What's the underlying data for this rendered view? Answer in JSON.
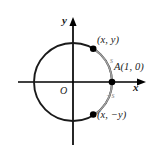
{
  "figure": {
    "background_color": "#ffffff",
    "axes": {
      "x_label": "x",
      "y_label": "y",
      "origin_label": "O",
      "axis_color": "#000000",
      "x_axis_y_px": 82,
      "y_axis_x_px": 73,
      "x_axis_span_px": [
        18,
        146
      ],
      "y_axis_span_px": [
        17,
        145
      ]
    },
    "circle": {
      "center_px": [
        73,
        82
      ],
      "radius_px": 39,
      "stroke_color": "#1a1a1a",
      "stroke_width": 1.8,
      "fill": "none"
    },
    "arcs": [
      {
        "name": "arc-positive-s",
        "label": "s",
        "label_color": "#8c8c8c",
        "stroke_color": "#9a9a9a",
        "from_point": "(x, y)",
        "to_point": "A(1, 0)",
        "direction": "clockwise-from-upper-point-to-A"
      },
      {
        "name": "arc-negative-s",
        "label": "−s",
        "label_color": "#8c8c8c",
        "stroke_color": "#9a9a9a",
        "from_point": "A(1, 0)",
        "to_point": "(x, −y)",
        "direction": "clockwise-from-A-to-lower-point"
      }
    ],
    "points": [
      {
        "name": "point-upper",
        "label": "(x, y)",
        "coordinates_px": [
          93,
          49
        ],
        "marker_color": "#000000",
        "marker_radius_px": 3.2
      },
      {
        "name": "point-A",
        "label": "A(1, 0)",
        "coordinates_px": [
          112,
          82
        ],
        "marker_color": "#000000",
        "marker_radius_px": 3.2
      },
      {
        "name": "point-lower",
        "label": "(x, −y)",
        "coordinates_px": [
          93,
          114
        ],
        "marker_color": "#000000",
        "marker_radius_px": 3.2
      }
    ]
  }
}
